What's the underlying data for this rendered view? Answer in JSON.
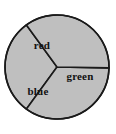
{
  "figure": {
    "kind": "spinner-pie-chart",
    "background_color": "#ffffff",
    "width": 116,
    "height": 134
  },
  "chart_data": {
    "type": "pie",
    "title": "",
    "subtitle": "",
    "xlabel": "",
    "ylabel": "",
    "grid": false,
    "legend_position": "none",
    "labels_inside_slices": true,
    "categories": [
      "red",
      "green",
      "blue"
    ],
    "values": [
      34,
      35,
      31
    ],
    "value_unit": "percent",
    "slice_fill_color": "#bfbfbf",
    "slice_border_color": "#1a1a1a",
    "label_color": "#111111",
    "slices": [
      {
        "label": "red",
        "value": 34,
        "start_angle_deg": 126,
        "end_angle_deg": 234,
        "fill": "#bfbfbf",
        "label_x": 42,
        "label_y": 46
      },
      {
        "label": "green",
        "value": 35,
        "start_angle_deg": 234,
        "end_angle_deg": 359,
        "fill": "#bfbfbf",
        "label_x": 80,
        "label_y": 77
      },
      {
        "label": "blue",
        "value": 31,
        "start_angle_deg": 359,
        "end_angle_deg": 126,
        "fill": "#bfbfbf",
        "label_x": 38,
        "label_y": 92
      }
    ],
    "geometry": {
      "center_x": 57,
      "center_y": 67,
      "radius": 52,
      "border_width": 1.6,
      "divider_width": 1.6
    }
  }
}
